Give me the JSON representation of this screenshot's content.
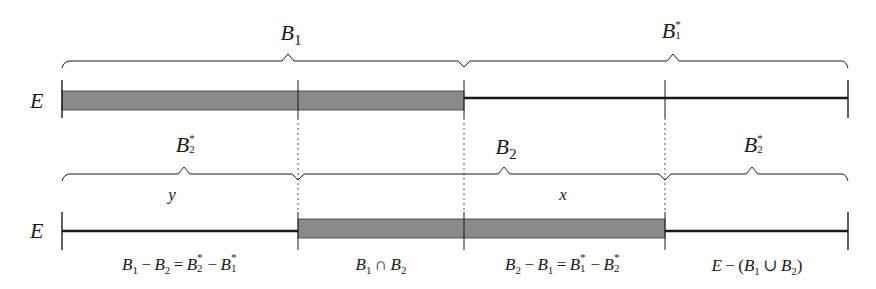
{
  "diagram": {
    "type": "set-partition-number-line",
    "set_label": "E",
    "rows": [
      {
        "id": "top",
        "set_label": "E",
        "braces": [
          {
            "label_base": "B",
            "label_sub": "1",
            "label_sup": "",
            "from": 62,
            "to": 464,
            "peak": 288
          },
          {
            "label_base": "B",
            "label_sub": "1",
            "label_sup": "*",
            "from": 464,
            "to": 848,
            "peak": 673
          }
        ],
        "shaded_segments": [
          {
            "from": 62,
            "to": 464
          }
        ],
        "line_segments": [
          {
            "from": 464,
            "to": 848
          }
        ],
        "ticks": [
          62,
          298,
          464,
          665,
          848
        ]
      },
      {
        "id": "bottom",
        "set_label": "E",
        "braces": [
          {
            "label_base": "B",
            "label_sub": "2",
            "label_sup": "*",
            "from": 62,
            "to": 298,
            "peak": 184
          },
          {
            "label_base": "B",
            "label_sub": "2",
            "label_sup": "",
            "from": 298,
            "to": 665,
            "peak": 504
          },
          {
            "label_base": "B",
            "label_sub": "2",
            "label_sup": "*",
            "from": 665,
            "to": 848,
            "peak": 752
          }
        ],
        "variables": [
          {
            "text": "y",
            "x": 172
          },
          {
            "text": "x",
            "x": 563
          }
        ],
        "shaded_segments": [
          {
            "from": 298,
            "to": 665
          }
        ],
        "line_segments": [
          {
            "from": 62,
            "to": 298
          },
          {
            "from": 665,
            "to": 848
          }
        ],
        "ticks": [
          62,
          298,
          464,
          665,
          848
        ]
      }
    ],
    "region_labels": [
      {
        "id": "b1-minus-b2",
        "text": "B1 − B2 = B2* − B1*",
        "x": 180
      },
      {
        "id": "b1-cap-b2",
        "text": "B1 ∩ B2",
        "x": 381
      },
      {
        "id": "b2-minus-b1",
        "text": "B2 − B1 = B1* − B2*",
        "x": 563
      },
      {
        "id": "complement-union",
        "text": "E − (B1 ∪ B2)",
        "x": 757
      }
    ],
    "colors": {
      "ink": "#1a1a1a",
      "shade": "#8a8a8a",
      "dotted": "#555555",
      "background": "#ffffff"
    }
  }
}
